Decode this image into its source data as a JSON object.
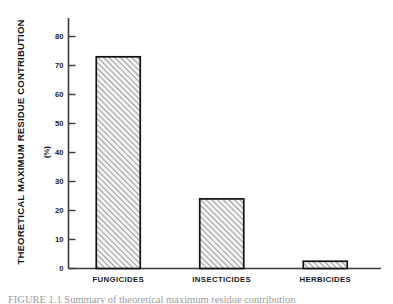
{
  "chart_data": {
    "type": "bar",
    "title": "",
    "subtitle": "",
    "categories": [
      "FUNGICIDES",
      "INSECTICIDES",
      "HERBICIDES"
    ],
    "values": [
      73,
      24,
      2.5
    ],
    "series": [
      {
        "name": "Theoretical Maximum Residue Contribution",
        "values": [
          73,
          24,
          2.5
        ]
      }
    ],
    "xlabel": "",
    "ylabel": "THEORETICAL MAXIMUM RESIDUE CONTRIBUTION",
    "yunit": "(%)",
    "ylim": [
      0,
      85
    ],
    "ytick_values": [
      0,
      10,
      20,
      30,
      40,
      50,
      60,
      70,
      80
    ],
    "ytick_labels": [
      "0",
      "10",
      "20",
      "30",
      "40",
      "50",
      "60",
      "70",
      "80"
    ],
    "grid": false,
    "legend": "none",
    "bar_fill": "#f2f2f2",
    "bar_hatch": "diagonal-forward-slash",
    "bar_hatch_color": "#6f6f6f",
    "bar_edge_color": "#111111",
    "axis_color": "#3a3a3a",
    "background": "#ffffff"
  },
  "axis": {
    "y_title": "THEORETICAL MAXIMUM RESIDUE CONTRIBUTION",
    "y_unit": "(%)"
  },
  "caption": {
    "text": "FIGURE 1.1  Summary of theoretical maximum residue contribution"
  }
}
